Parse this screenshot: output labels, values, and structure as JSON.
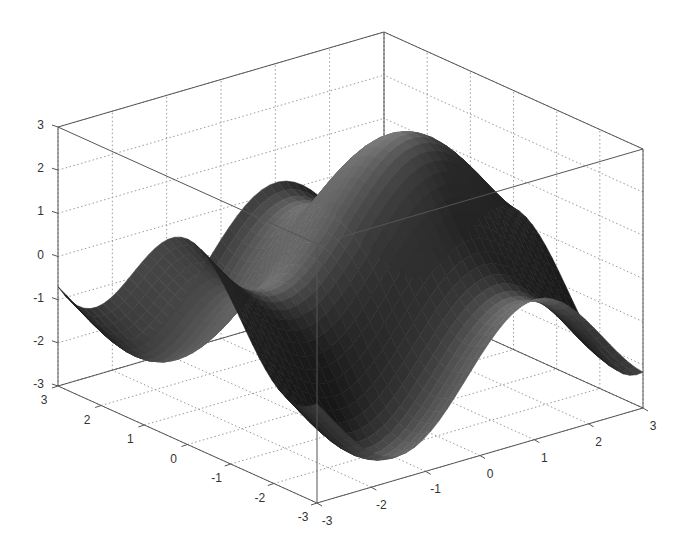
{
  "chart_data": {
    "type": "surface3d",
    "title": "",
    "xlabel": "",
    "ylabel": "",
    "zlabel": "",
    "function_estimate": "z = sin(x) + cos(y) style wave surface (peaks ~2.5, troughs ~-2.5)",
    "xlim": [
      -3,
      3
    ],
    "ylim": [
      -3,
      3
    ],
    "zlim": [
      -3,
      3
    ],
    "x_ticks": [
      "-3",
      "-2",
      "-1",
      "0",
      "1",
      "2",
      "3"
    ],
    "y_ticks": [
      "3",
      "2",
      "1",
      "0",
      "-1",
      "-2",
      "-3"
    ],
    "z_ticks": [
      "3",
      "2",
      "1",
      "0",
      "-1",
      "-2",
      "-3"
    ],
    "grid": true,
    "grid_style": "dotted",
    "colormap": "grayscale",
    "box": true,
    "features": {
      "peaks": [
        {
          "approx_screen": [
            120,
            148
          ],
          "z": 2.5
        },
        {
          "approx_screen": [
            312,
            128
          ],
          "z": 2.7
        },
        {
          "approx_screen": [
            560,
            137
          ],
          "z": 2.6
        }
      ],
      "troughs": [
        {
          "approx_screen": [
            300,
            465
          ],
          "z": -2.7
        },
        {
          "approx_screen": [
            486,
            378
          ],
          "z": -2.5
        }
      ]
    }
  },
  "axes": {
    "z_axis_labels": [
      "3",
      "2",
      "1",
      "0",
      "-1",
      "-2",
      "-3"
    ],
    "y_axis_labels": [
      "3",
      "2",
      "1",
      "0",
      "-1",
      "-2",
      "-3"
    ],
    "x_axis_labels": [
      "-3",
      "-2",
      "-1",
      "0",
      "1",
      "2",
      "3"
    ]
  },
  "colors": {
    "box_line": "#555555",
    "grid_line": "#9a9a9a",
    "surface_dark": "#1e1e1e",
    "surface_light": "#8a8a8a",
    "background": "#ffffff"
  }
}
